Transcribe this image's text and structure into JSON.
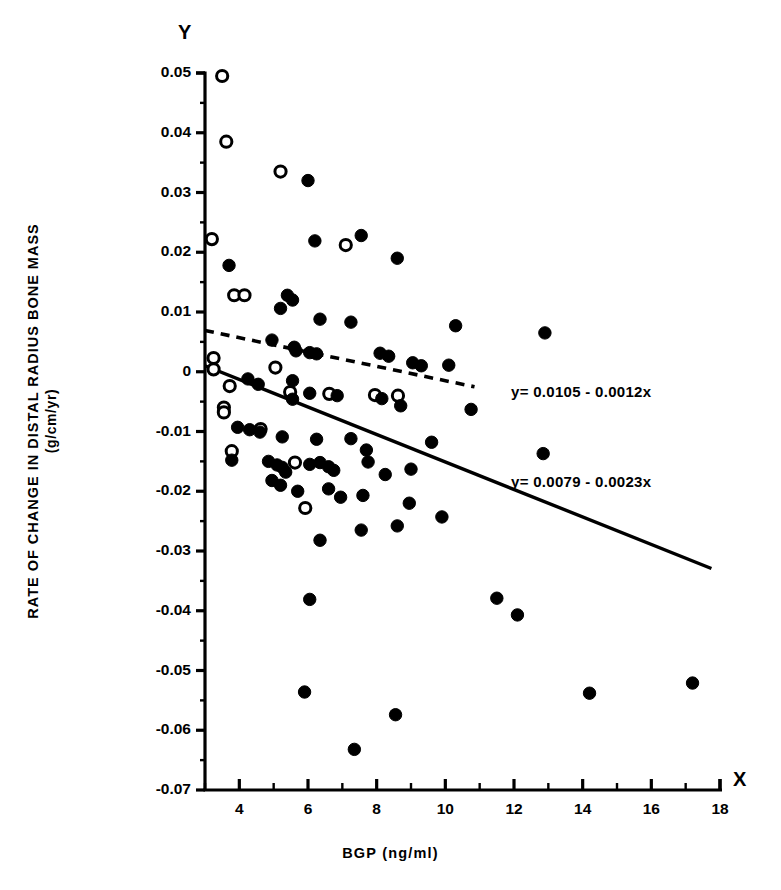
{
  "figure": {
    "axis_letters": {
      "y": "Y",
      "x": "X"
    },
    "y_axis_title_line1": "RATE OF CHANGE IN DISTAL RADIUS BONE MASS",
    "y_axis_title_line2": "(g/cm/yr)",
    "x_axis_title": "BGP (ng/ml)",
    "ink_color": "#000000",
    "background_color": "#ffffff"
  },
  "chart_data": {
    "type": "scatter",
    "title": "",
    "xlabel": "BGP (ng/ml)",
    "ylabel": "RATE OF CHANGE IN DISTAL RADIUS BONE MASS (g/cm/yr)",
    "xlim": [
      3,
      18
    ],
    "ylim": [
      -0.07,
      0.05
    ],
    "xticks": [
      4,
      6,
      8,
      10,
      12,
      14,
      16,
      18
    ],
    "xtick_labels": [
      "4",
      "6",
      "8",
      "10",
      "12",
      "14",
      "16",
      "18"
    ],
    "xticks_minor": [
      3,
      5,
      7,
      9,
      11,
      13,
      15,
      17
    ],
    "yticks": [
      0.05,
      0.04,
      0.03,
      0.02,
      0.01,
      0,
      -0.01,
      -0.02,
      -0.03,
      -0.04,
      -0.05,
      -0.06,
      -0.07
    ],
    "ytick_labels": [
      "0.05",
      "0.04",
      "0.03",
      "0.02",
      "0.01",
      "0",
      "-0.01",
      "-0.02",
      "-0.03",
      "-0.04",
      "-0.05",
      "-0.06",
      "-0.07"
    ],
    "grid": false,
    "legend": "none",
    "series": [
      {
        "name": "open-circles",
        "marker": "open circle",
        "values": [
          [
            3.5,
            0.0495
          ],
          [
            3.62,
            0.0385
          ],
          [
            5.2,
            0.0335
          ],
          [
            7.1,
            0.0212
          ],
          [
            3.2,
            0.0222
          ],
          [
            3.85,
            0.0128
          ],
          [
            4.15,
            0.0128
          ],
          [
            3.25,
            0.0023
          ],
          [
            3.25,
            0.0004
          ],
          [
            3.72,
            -0.0024
          ],
          [
            5.05,
            0.0007
          ],
          [
            5.48,
            -0.0034
          ],
          [
            6.62,
            -0.0037
          ],
          [
            7.95,
            -0.0039
          ],
          [
            8.62,
            -0.004
          ],
          [
            3.55,
            -0.006
          ],
          [
            3.55,
            -0.0068
          ],
          [
            3.78,
            -0.0133
          ],
          [
            4.62,
            -0.0096
          ],
          [
            5.62,
            -0.0152
          ],
          [
            5.92,
            -0.0228
          ]
        ]
      },
      {
        "name": "filled-circles",
        "marker": "filled circle",
        "values": [
          [
            6.0,
            0.032
          ],
          [
            7.55,
            0.0228
          ],
          [
            6.2,
            0.0219
          ],
          [
            3.7,
            0.0178
          ],
          [
            8.6,
            0.019
          ],
          [
            5.4,
            0.0128
          ],
          [
            5.55,
            0.012
          ],
          [
            5.2,
            0.0106
          ],
          [
            6.35,
            0.0088
          ],
          [
            7.25,
            0.0083
          ],
          [
            10.3,
            0.0077
          ],
          [
            12.9,
            0.0065
          ],
          [
            4.95,
            0.0053
          ],
          [
            5.6,
            0.0041
          ],
          [
            5.65,
            0.0035
          ],
          [
            6.05,
            0.0032
          ],
          [
            6.25,
            0.003
          ],
          [
            8.1,
            0.0031
          ],
          [
            8.35,
            0.0026
          ],
          [
            9.05,
            0.0015
          ],
          [
            9.3,
            0.001
          ],
          [
            10.1,
            0.0011
          ],
          [
            4.25,
            -0.0012
          ],
          [
            4.55,
            -0.0021
          ],
          [
            5.55,
            -0.0015
          ],
          [
            5.55,
            -0.0046
          ],
          [
            6.05,
            -0.0036
          ],
          [
            6.85,
            -0.004
          ],
          [
            8.15,
            -0.0045
          ],
          [
            8.7,
            -0.0057
          ],
          [
            10.75,
            -0.0063
          ],
          [
            3.95,
            -0.0093
          ],
          [
            4.3,
            -0.0097
          ],
          [
            4.6,
            -0.0101
          ],
          [
            5.25,
            -0.0109
          ],
          [
            6.25,
            -0.0113
          ],
          [
            7.25,
            -0.0112
          ],
          [
            7.7,
            -0.0131
          ],
          [
            9.6,
            -0.0118
          ],
          [
            12.85,
            -0.0137
          ],
          [
            3.78,
            -0.0148
          ],
          [
            4.85,
            -0.015
          ],
          [
            5.1,
            -0.0156
          ],
          [
            5.25,
            -0.016
          ],
          [
            5.35,
            -0.0168
          ],
          [
            6.05,
            -0.0155
          ],
          [
            6.35,
            -0.0152
          ],
          [
            6.6,
            -0.0159
          ],
          [
            6.75,
            -0.0165
          ],
          [
            7.75,
            -0.0151
          ],
          [
            8.25,
            -0.0172
          ],
          [
            9.0,
            -0.0163
          ],
          [
            4.95,
            -0.0182
          ],
          [
            5.2,
            -0.019
          ],
          [
            5.7,
            -0.02
          ],
          [
            6.6,
            -0.0196
          ],
          [
            6.95,
            -0.021
          ],
          [
            7.6,
            -0.0207
          ],
          [
            8.95,
            -0.022
          ],
          [
            9.9,
            -0.0243
          ],
          [
            6.35,
            -0.0282
          ],
          [
            7.55,
            -0.0265
          ],
          [
            8.6,
            -0.0258
          ],
          [
            6.05,
            -0.0381
          ],
          [
            11.5,
            -0.0379
          ],
          [
            12.1,
            -0.0407
          ],
          [
            5.9,
            -0.0536
          ],
          [
            14.2,
            -0.0538
          ],
          [
            17.2,
            -0.0521
          ],
          [
            8.55,
            -0.0574
          ],
          [
            7.35,
            -0.0632
          ]
        ]
      }
    ],
    "fit_lines": [
      {
        "name": "dashed-regression",
        "style": "dashed",
        "equation": "y= 0.0105 - 0.0012x",
        "intercept": 0.0105,
        "slope": -0.0012,
        "x_start": 3.0,
        "x_end": 10.85
      },
      {
        "name": "solid-regression",
        "style": "solid",
        "equation": "y= 0.0079 - 0.0023x",
        "intercept": 0.0079,
        "slope": -0.0023,
        "x_start": 3.0,
        "x_end": 17.75
      }
    ]
  }
}
